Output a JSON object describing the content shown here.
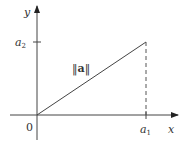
{
  "diagram": {
    "axes": {
      "x_label": "x",
      "y_label": "y",
      "origin_label": "0"
    },
    "ticks": {
      "x_tick": {
        "base": "a",
        "sub": "1"
      },
      "y_tick": {
        "base": "a",
        "sub": "2"
      }
    },
    "vector_label": {
      "open": "‖",
      "symbol": "a",
      "close": "‖"
    },
    "colors": {
      "line": "#333333",
      "axis": "#333333",
      "dashed": "#555555"
    }
  }
}
